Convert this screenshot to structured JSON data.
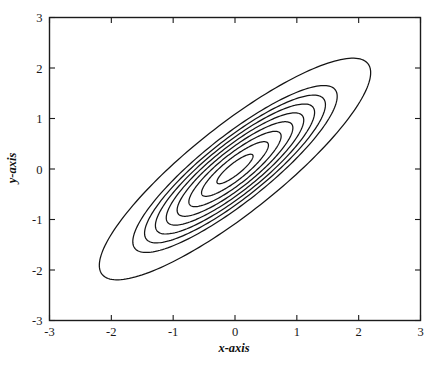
{
  "chart_data": {
    "type": "line",
    "subtype": "contour",
    "title": "",
    "subtitle": "",
    "xlabel": "x-axis",
    "ylabel": "y-axis",
    "xlim": [
      -3,
      3
    ],
    "ylim": [
      -3,
      3
    ],
    "xticks": [
      -3,
      -2,
      -1,
      0,
      1,
      2,
      3
    ],
    "yticks": [
      -3,
      -2,
      -1,
      0,
      1,
      2,
      3
    ],
    "xtick_labels": [
      "-3",
      "-2",
      "-1",
      "0",
      "1",
      "2",
      "3"
    ],
    "ytick_labels": [
      "-3",
      "-2",
      "-1",
      "0",
      "1",
      "2",
      "3"
    ],
    "grid": false,
    "legend": null,
    "annotations": [],
    "center": [
      0.0,
      0.0
    ],
    "orientation_deg": 45,
    "correlation": 0.8,
    "sigma_x": 1.0,
    "sigma_y": 1.0,
    "n_contours": 9,
    "contours": [
      {
        "index": 1,
        "semi_major": 0.4,
        "semi_minor": 0.105,
        "angle_deg": 45
      },
      {
        "index": 2,
        "semi_major": 0.74,
        "semi_minor": 0.195,
        "angle_deg": 45
      },
      {
        "index": 3,
        "semi_major": 1.02,
        "semi_minor": 0.27,
        "angle_deg": 45
      },
      {
        "index": 4,
        "semi_major": 1.28,
        "semi_minor": 0.338,
        "angle_deg": 45
      },
      {
        "index": 5,
        "semi_major": 1.52,
        "semi_minor": 0.402,
        "angle_deg": 45
      },
      {
        "index": 6,
        "semi_major": 1.76,
        "semi_minor": 0.465,
        "angle_deg": 45
      },
      {
        "index": 7,
        "semi_major": 2.0,
        "semi_minor": 0.528,
        "angle_deg": 45
      },
      {
        "index": 8,
        "semi_major": 2.26,
        "semi_minor": 0.597,
        "angle_deg": 45
      },
      {
        "index": 9,
        "semi_major": 3.0,
        "semi_minor": 0.793,
        "angle_deg": 45
      }
    ],
    "axis_color": "#1b1b1b",
    "contour_color": "#141414",
    "background_color": "#ffffff"
  }
}
